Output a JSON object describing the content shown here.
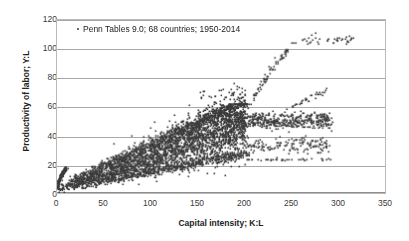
{
  "chart_data": {
    "type": "scatter",
    "title": "",
    "xlabel": "Capital intensity; K:L",
    "ylabel": "Productivity of labor; Y:L",
    "xlim": [
      0,
      350
    ],
    "ylim": [
      0,
      120
    ],
    "xticks": [
      0,
      50,
      100,
      150,
      200,
      250,
      300,
      350
    ],
    "yticks": [
      0,
      20,
      40,
      60,
      80,
      100,
      120
    ],
    "grid": "horizontal",
    "legend_position": "inside-top-left",
    "series": [
      {
        "name": "Penn Tables 9.0; 68 countries; 1950-2014",
        "marker": "dot",
        "color": "#3a3a3a",
        "n_points": 4420,
        "description": "Dense fan-shaped cloud of country-year observations rising from the origin; main band spans K:L 0-290 with Y:L 0-60, a steep high-productivity arm reaching Y:L 112 at K:L 250-315, and sparse low arms near Y:L 23-24 extending to K:L 290.",
        "clusters": [
          {
            "name": "origin-hook-upper-envelope",
            "x_range": [
              0,
              12
            ],
            "y_range": [
              0,
              18
            ],
            "n": 160,
            "note": "near-vertical hook of points rising steeply just right of the y-axis"
          },
          {
            "name": "main-fan-core",
            "x_range": [
              0,
              200
            ],
            "y_range": [
              0,
              50
            ],
            "n": 2400,
            "note": "densest elongated band, slope roughly 0.26"
          },
          {
            "name": "main-fan-upper",
            "x_range": [
              40,
              200
            ],
            "y_range": [
              12,
              62
            ],
            "n": 780,
            "note": "upper envelope of the fan reaching 60 near K:L 180"
          },
          {
            "name": "main-fan-lower",
            "x_range": [
              30,
              200
            ],
            "y_range": [
              5,
              30
            ],
            "n": 520,
            "note": "lower envelope of the fan"
          },
          {
            "name": "plateau-band",
            "x_range": [
              185,
              300
            ],
            "y_range": [
              38,
              62
            ],
            "n": 430,
            "note": "flat saturated band between 40 and 60"
          },
          {
            "name": "steep-high-arm",
            "x_range": [
              205,
              250
            ],
            "y_range": [
              60,
              100
            ],
            "n": 55,
            "note": "steeply rising outlier arm"
          },
          {
            "name": "top-plateau",
            "x_range": [
              248,
              315
            ],
            "y_range": [
              103,
              112
            ],
            "n": 30,
            "note": "topmost points around Y:L 105-112"
          },
          {
            "name": "secondary-rise",
            "x_range": [
              250,
              290
            ],
            "y_range": [
              60,
              72
            ],
            "n": 22,
            "note": "small rising arm toward Y:L 70"
          },
          {
            "name": "low-right-arm",
            "x_range": [
              205,
              292
            ],
            "y_range": [
              22,
              26
            ],
            "n": 26,
            "note": "sparse flat arm near Y:L 23"
          },
          {
            "name": "mid-right-scatter",
            "x_range": [
              200,
              290
            ],
            "y_range": [
              26,
              40
            ],
            "n": 120,
            "note": "scattered mid band"
          }
        ],
        "xy_samples": [
          [
            2,
            1
          ],
          [
            3,
            3
          ],
          [
            4,
            6
          ],
          [
            5,
            9
          ],
          [
            6,
            12
          ],
          [
            7,
            14
          ],
          [
            8,
            16
          ],
          [
            9,
            17
          ],
          [
            10,
            17
          ],
          [
            12,
            17
          ],
          [
            15,
            8
          ],
          [
            20,
            10
          ],
          [
            25,
            12
          ],
          [
            30,
            14
          ],
          [
            35,
            16
          ],
          [
            40,
            18
          ],
          [
            45,
            20
          ],
          [
            50,
            21
          ],
          [
            60,
            24
          ],
          [
            70,
            27
          ],
          [
            80,
            29
          ],
          [
            90,
            31
          ],
          [
            100,
            33
          ],
          [
            110,
            35
          ],
          [
            120,
            37
          ],
          [
            130,
            39
          ],
          [
            140,
            41
          ],
          [
            150,
            43
          ],
          [
            160,
            45
          ],
          [
            170,
            47
          ],
          [
            180,
            49
          ],
          [
            190,
            50
          ],
          [
            60,
            34
          ],
          [
            80,
            40
          ],
          [
            100,
            45
          ],
          [
            120,
            50
          ],
          [
            140,
            54
          ],
          [
            160,
            58
          ],
          [
            180,
            60
          ],
          [
            60,
            14
          ],
          [
            80,
            17
          ],
          [
            100,
            20
          ],
          [
            120,
            23
          ],
          [
            140,
            26
          ],
          [
            160,
            14
          ],
          [
            180,
            22
          ],
          [
            200,
            52
          ],
          [
            215,
            55
          ],
          [
            230,
            57
          ],
          [
            245,
            58
          ],
          [
            260,
            57
          ],
          [
            275,
            56
          ],
          [
            285,
            55
          ],
          [
            205,
            62
          ],
          [
            212,
            68
          ],
          [
            218,
            75
          ],
          [
            222,
            82
          ],
          [
            226,
            88
          ],
          [
            232,
            94
          ],
          [
            240,
            96
          ],
          [
            245,
            99
          ],
          [
            252,
            104
          ],
          [
            262,
            106
          ],
          [
            272,
            110
          ],
          [
            276,
            111
          ],
          [
            288,
            106
          ],
          [
            298,
            106
          ],
          [
            308,
            107
          ],
          [
            314,
            107
          ],
          [
            255,
            62
          ],
          [
            265,
            66
          ],
          [
            272,
            68
          ],
          [
            280,
            70
          ],
          [
            286,
            71
          ],
          [
            208,
            23
          ],
          [
            225,
            23
          ],
          [
            240,
            23
          ],
          [
            258,
            23
          ],
          [
            272,
            24
          ],
          [
            282,
            24
          ],
          [
            290,
            24
          ],
          [
            205,
            33
          ],
          [
            220,
            30
          ],
          [
            235,
            35
          ],
          [
            250,
            38
          ],
          [
            265,
            40
          ],
          [
            280,
            46
          ],
          [
            288,
            48
          ]
        ]
      }
    ]
  },
  "legend": {
    "entry": "Penn Tables 9.0; 68 countries; 1950-2014"
  },
  "axes": {
    "x": {
      "title": "Capital intensity; K:L",
      "tick_labels": [
        "0",
        "50",
        "100",
        "150",
        "200",
        "250",
        "300",
        "350"
      ]
    },
    "y": {
      "title": "Productivity of labor; Y:L",
      "tick_labels": [
        "0",
        "20",
        "40",
        "60",
        "80",
        "100",
        "120"
      ]
    }
  },
  "style": {
    "marker_color": "#3a3a3a",
    "grid_color": "#a8a8a8",
    "frame_color": "#b9b9b9",
    "text_color": "#222222",
    "background": "#ffffff"
  }
}
